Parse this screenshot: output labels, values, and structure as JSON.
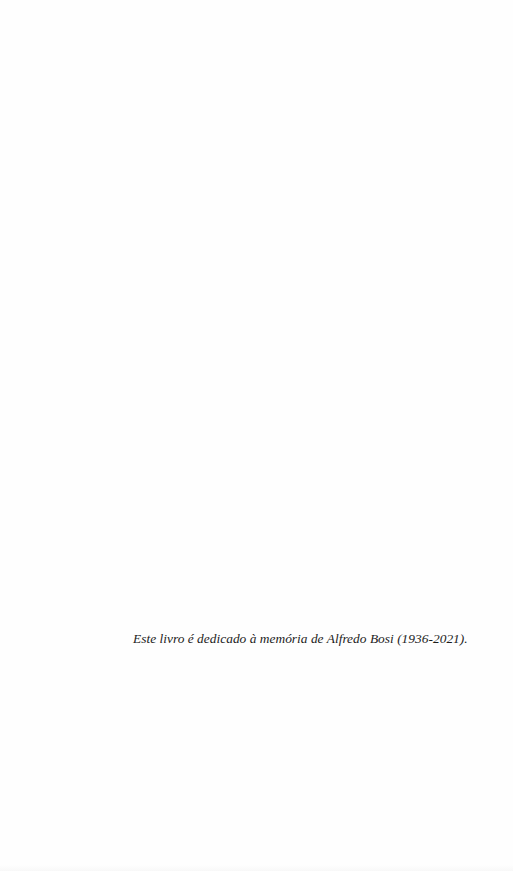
{
  "page": {
    "type": "dedication-page",
    "background_color": "#fefefe",
    "text_color": "#1c1c1c"
  },
  "dedication": {
    "text": "Este livro é dedicado à memória de Alfredo Bosi (1936-2021)."
  }
}
